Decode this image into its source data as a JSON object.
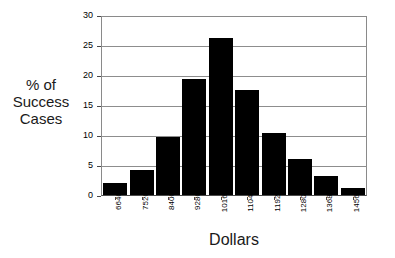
{
  "chart_data": {
    "type": "bar",
    "title": "",
    "xlabel": "Dollars",
    "ylabel_lines": [
      "% of",
      "Success",
      "Cases"
    ],
    "categories": [
      "6640",
      "7520",
      "8400",
      "9280",
      "10160",
      "11040",
      "11920",
      "12800",
      "13680",
      "14560"
    ],
    "values": [
      2.0,
      4.2,
      9.7,
      19.6,
      26.5,
      17.7,
      10.5,
      6.0,
      3.2,
      1.2
    ],
    "ylim": [
      0,
      30
    ],
    "ytick_labels": [
      "0",
      "5",
      "10",
      "15",
      "20",
      "25",
      "30"
    ],
    "ytick_values": [
      0,
      5,
      10,
      15,
      20,
      25,
      30
    ],
    "grid": true,
    "legend": false,
    "bar_color": "#000000",
    "grid_color": "#8d8d8d",
    "axis_color": "#4a4a4a"
  }
}
